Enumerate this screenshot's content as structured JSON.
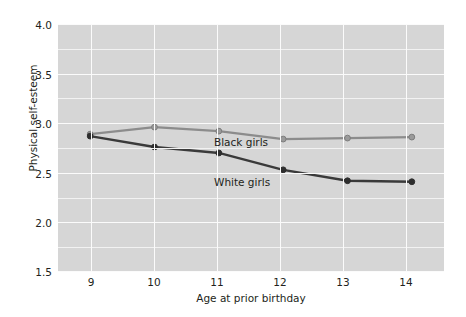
{
  "chart_data": {
    "type": "line",
    "title": "",
    "subtitle": "",
    "xlabel": "Age at prior birthday",
    "ylabel": "Physical self-esteem",
    "x": [
      9,
      10,
      11,
      12,
      13,
      14
    ],
    "xtick_labels": [
      "9",
      "10",
      "11",
      "12",
      "13",
      "14"
    ],
    "ytick_labels": [
      "1.5",
      "2.0",
      "2.5",
      "3.0",
      "3.5",
      "4.0"
    ],
    "ytick_values": [
      1.5,
      2.0,
      2.5,
      3.0,
      3.5,
      4.0
    ],
    "xlim": [
      8.5,
      14.5
    ],
    "ylim": [
      1.5,
      4.0
    ],
    "grid": true,
    "grid_major_step": 0.5,
    "grid_minor_step": 0.25,
    "legend_position": "inline-annotation",
    "plot_background": "#d6d6d6",
    "gridline_color": "#f7f7f7",
    "series": [
      {
        "name": "Black girls",
        "color": "#8c8c8c",
        "marker": "circle",
        "values": [
          2.89,
          2.96,
          2.92,
          2.84,
          2.85,
          2.86
        ]
      },
      {
        "name": "White girls",
        "color": "#3a3a3a",
        "marker": "circle",
        "values": [
          2.87,
          2.76,
          2.7,
          2.53,
          2.42,
          2.41
        ]
      }
    ],
    "annotations": [
      {
        "text": "Black girls",
        "x": 11.0,
        "y": 3.06
      },
      {
        "text": "White girls",
        "x": 11.0,
        "y": 2.66
      }
    ]
  },
  "axes": {
    "y_ticks": [
      {
        "label": "4.0"
      },
      {
        "label": "3.5"
      },
      {
        "label": "3.0"
      },
      {
        "label": "2.5"
      },
      {
        "label": "2.0"
      },
      {
        "label": "1.5"
      }
    ],
    "x_ticks": [
      {
        "label": "9"
      },
      {
        "label": "10"
      },
      {
        "label": "11"
      },
      {
        "label": "12"
      },
      {
        "label": "13"
      },
      {
        "label": "14"
      }
    ],
    "x_title": "Age at prior birthday",
    "y_title": "Physical self-esteem"
  },
  "labels": {
    "black_series": "Black girls",
    "white_series": "White girls"
  }
}
